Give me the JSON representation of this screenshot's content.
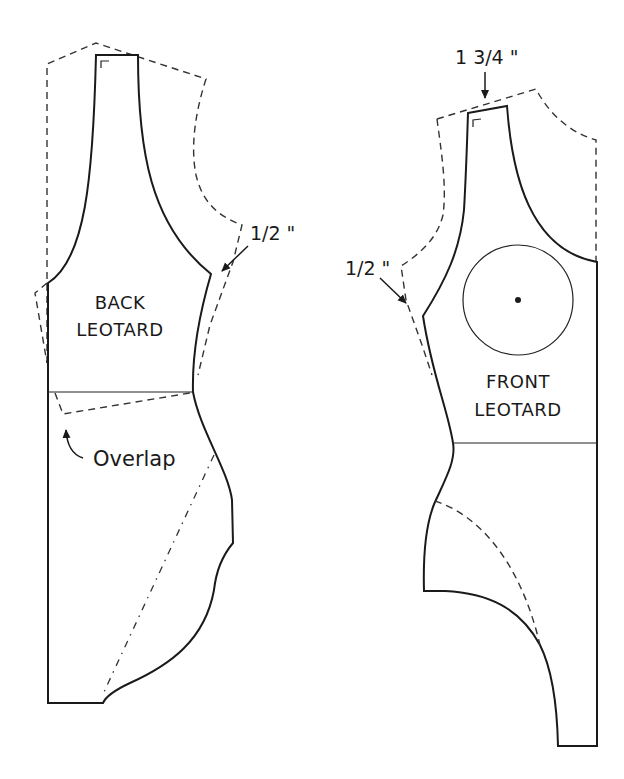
{
  "diagram": {
    "type": "sewing-pattern",
    "pieces": [
      {
        "id": "back",
        "label_line1": "BACK",
        "label_line2": "LEOTARD",
        "annotations": {
          "armhole_measure": "1/2 \"",
          "overlap_note": "Overlap"
        }
      },
      {
        "id": "front",
        "label_line1": "FRONT",
        "label_line2": "LEOTARD",
        "annotations": {
          "shoulder_measure": "1 3/4 \"",
          "armhole_measure": "1/2 \""
        }
      }
    ],
    "line_styles": {
      "stroke_color": "#1a1a1a",
      "original_pattern": "dashed",
      "new_pattern": "solid",
      "reference_line": "dash-dot"
    }
  }
}
